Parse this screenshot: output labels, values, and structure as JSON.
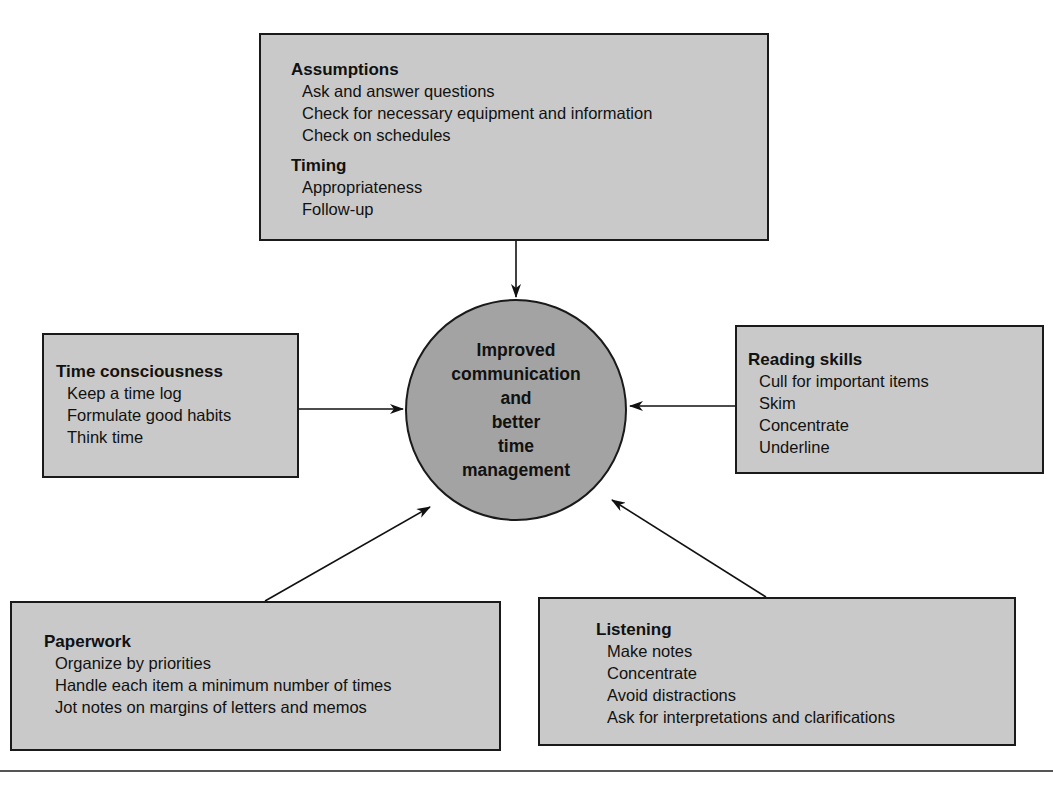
{
  "center": {
    "lines": [
      "Improved",
      "communication",
      "and",
      "better",
      "time",
      "management"
    ]
  },
  "boxes": {
    "top": {
      "groups": [
        {
          "heading": "Assumptions",
          "items": [
            "Ask and answer questions",
            "Check for necessary equipment and information",
            "Check on schedules"
          ]
        },
        {
          "heading": "Timing",
          "items": [
            "Appropriateness",
            "Follow-up"
          ]
        }
      ]
    },
    "left": {
      "groups": [
        {
          "heading": "Time consciousness",
          "items": [
            "Keep a time log",
            "Formulate good habits",
            "Think time"
          ]
        }
      ]
    },
    "right": {
      "groups": [
        {
          "heading": "Reading skills",
          "items": [
            "Cull for important items",
            "Skim",
            "Concentrate",
            "Underline"
          ]
        }
      ]
    },
    "bottom_left": {
      "groups": [
        {
          "heading": "Paperwork",
          "items": [
            "Organize by priorities",
            "Handle each item a minimum number of times",
            "Jot notes on margins of letters and memos"
          ]
        }
      ]
    },
    "bottom_right": {
      "groups": [
        {
          "heading": "Listening",
          "items": [
            "Make notes",
            "Concentrate",
            "Avoid distractions",
            "Ask for interpretations and clarifications"
          ]
        }
      ]
    }
  },
  "colors": {
    "box_fill": "#c9c9c9",
    "circle_fill": "#a3a3a3",
    "stroke": "#1a1a1a"
  }
}
